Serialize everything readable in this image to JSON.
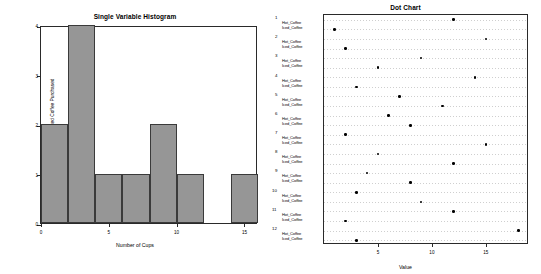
{
  "histogram": {
    "title": "Single Variable Histogram",
    "xlabel": "Number of Cups",
    "ylabel": "Frequency of Iced Coffee Purchased",
    "yticks": [
      "0",
      "1",
      "2",
      "3",
      "4"
    ],
    "xticks": [
      "0",
      "5",
      "10",
      "15"
    ]
  },
  "dotchart": {
    "title": "Dot Chart",
    "xlabel": "Value",
    "xticks": [
      "5",
      "10",
      "15"
    ],
    "group_numbers": [
      "1",
      "2",
      "3",
      "4",
      "5",
      "6",
      "7",
      "8",
      "9",
      "10",
      "11",
      "12"
    ],
    "series_labels": [
      "Hot_Coffee",
      "Iced_Coffee"
    ]
  },
  "chart_data": [
    {
      "type": "bar",
      "title": "Single Variable Histogram",
      "xlabel": "Number of Cups",
      "ylabel": "Frequency of Iced Coffee Purchased",
      "categories": [
        "0-2",
        "2-4",
        "4-6",
        "6-8",
        "8-10",
        "10-12",
        "12-14",
        "14-16"
      ],
      "bin_edges": [
        0,
        2,
        4,
        6,
        8,
        10,
        12,
        14,
        16
      ],
      "values": [
        2,
        4,
        1,
        1,
        2,
        1,
        0,
        1
      ],
      "xlim": [
        0,
        16
      ],
      "ylim": [
        0,
        4
      ],
      "grid": false,
      "bar_color": "#969696",
      "bar_edge_color": "#3a3a3a"
    },
    {
      "type": "scatter",
      "title": "Dot Chart",
      "xlabel": "Value",
      "ylabel": "",
      "xlim": [
        0,
        19
      ],
      "grid": true,
      "legend": "none",
      "dot_color": "#000000",
      "categories": [
        "1 Hot_Coffee",
        "1 Iced_Coffee",
        "2 Hot_Coffee",
        "2 Iced_Coffee",
        "3 Hot_Coffee",
        "3 Iced_Coffee",
        "4 Hot_Coffee",
        "4 Iced_Coffee",
        "5 Hot_Coffee",
        "5 Iced_Coffee",
        "6 Hot_Coffee",
        "6 Iced_Coffee",
        "7 Hot_Coffee",
        "7 Iced_Coffee",
        "8 Hot_Coffee",
        "8 Iced_Coffee",
        "9 Hot_Coffee",
        "9 Iced_Coffee",
        "10 Hot_Coffee",
        "10 Iced_Coffee",
        "11 Hot_Coffee",
        "11 Iced_Coffee",
        "12 Hot_Coffee",
        "12 Iced_Coffee"
      ],
      "series": [
        {
          "name": "Hot_Coffee",
          "values": [
            12,
            15,
            9,
            14,
            7,
            6,
            2,
            5,
            4,
            3,
            12,
            18
          ]
        },
        {
          "name": "Iced_Coffee",
          "values": [
            1,
            2,
            5,
            3,
            11,
            8,
            15,
            12,
            8,
            9,
            2,
            3
          ]
        }
      ]
    }
  ]
}
